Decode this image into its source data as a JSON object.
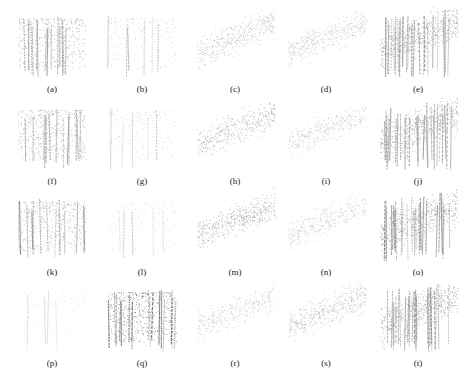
{
  "figure": {
    "columns": 5,
    "rows": 4,
    "column_centers_x": [
      52,
      142,
      235,
      326,
      418
    ],
    "row_tops_y": [
      4,
      96,
      187,
      278
    ],
    "panels": [
      {
        "label": "(a)",
        "style": "trees",
        "density": 0.75,
        "darkness": 0.55
      },
      {
        "label": "(b)",
        "style": "trees",
        "density": 0.35,
        "darkness": 0.35
      },
      {
        "label": "(c)",
        "style": "canopy",
        "density": 0.75,
        "darkness": 0.45
      },
      {
        "label": "(d)",
        "style": "canopy",
        "density": 0.75,
        "darkness": 0.4
      },
      {
        "label": "(e)",
        "style": "forest",
        "density": 1.0,
        "darkness": 0.6
      },
      {
        "label": "(f)",
        "style": "trees",
        "density": 0.75,
        "darkness": 0.55
      },
      {
        "label": "(g)",
        "style": "trees",
        "density": 0.3,
        "darkness": 0.3
      },
      {
        "label": "(h)",
        "style": "canopy",
        "density": 0.8,
        "darkness": 0.5
      },
      {
        "label": "(i)",
        "style": "canopy",
        "density": 0.7,
        "darkness": 0.38
      },
      {
        "label": "(j)",
        "style": "forest",
        "density": 1.0,
        "darkness": 0.62
      },
      {
        "label": "(k)",
        "style": "trees",
        "density": 0.8,
        "darkness": 0.55
      },
      {
        "label": "(l)",
        "style": "trees",
        "density": 0.25,
        "darkness": 0.28
      },
      {
        "label": "(m)",
        "style": "canopy",
        "density": 0.9,
        "darkness": 0.58
      },
      {
        "label": "(n)",
        "style": "canopy",
        "density": 0.65,
        "darkness": 0.38
      },
      {
        "label": "(o)",
        "style": "forest",
        "density": 1.0,
        "darkness": 0.62
      },
      {
        "label": "(p)",
        "style": "trees",
        "density": 0.25,
        "darkness": 0.18
      },
      {
        "label": "(q)",
        "style": "trees",
        "density": 0.95,
        "darkness": 0.75
      },
      {
        "label": "(r)",
        "style": "canopy",
        "density": 0.6,
        "darkness": 0.4
      },
      {
        "label": "(s)",
        "style": "canopy",
        "density": 0.85,
        "darkness": 0.45
      },
      {
        "label": "(t)",
        "style": "forest",
        "density": 1.0,
        "darkness": 0.62
      }
    ]
  }
}
